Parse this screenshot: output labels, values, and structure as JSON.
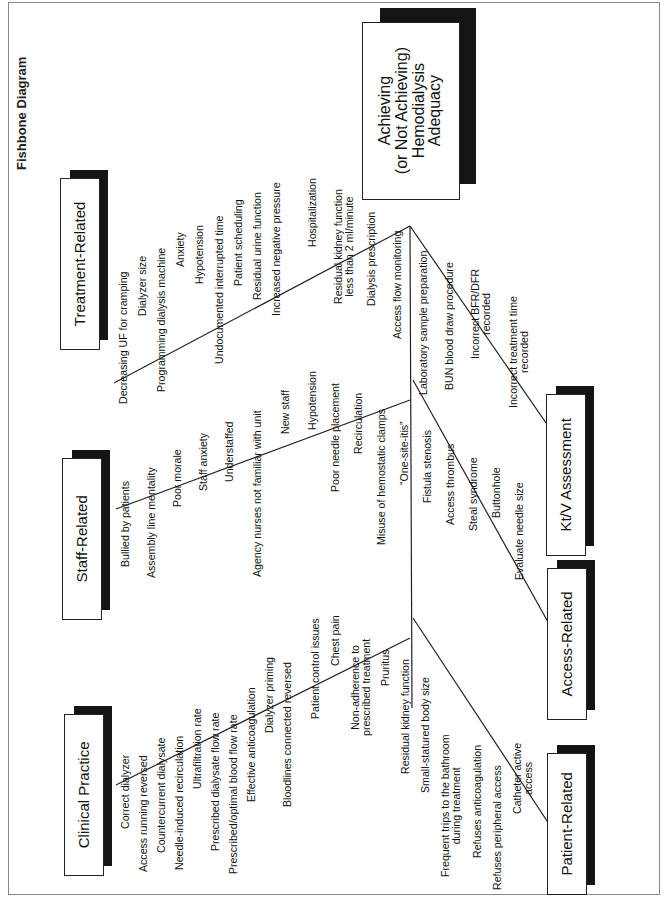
{
  "title_fragment": "Fishbone Diagram",
  "effect": {
    "label": "Achieving\n(or Not Achieving)\nHemodialysis\nAdequacy"
  },
  "categories": [
    {
      "id": "treatment",
      "label": "Treatment-Related",
      "items": [
        "Decreasing UF for cramping",
        "Dialyzer size",
        "Programming dialysis machine",
        "Anxiety",
        "Hypotension",
        "Undocumented interrupted time",
        "Patient scheduling",
        "Residual urine function",
        "Increased negative pressure"
      ]
    },
    {
      "id": "staff",
      "label": "Staff-Related",
      "items": [
        "Bullied by patients",
        "Assembly line mentality",
        "Poor morale",
        "Staff anxiety",
        "Understaffed",
        "Agency nurses not familiar with unit",
        "New staff"
      ]
    },
    {
      "id": "clinical",
      "label": "Clinical Practice",
      "items": [
        "Correct dialyzer",
        "Access running reversed",
        "Countercurrent dialysate",
        "Needle-induced recirculation",
        "Ultrafiltration rate",
        "Prescribed dialysate flow rate",
        "Prescribed/optimal blood flow rate",
        "Effective anticoagulation",
        "Dialyzer priming",
        "Bloodlines connected reversed"
      ]
    },
    {
      "id": "ktv",
      "label": "Kt/V Assessment",
      "items": [
        "Hospitalization",
        "Residual kidney function\nless than 2 ml/minute",
        "Dialysis prescription",
        "Access flow monitoring",
        "Laboratory sample preparation",
        "BUN blood draw procedure",
        "Incorrect BFR/DFR\nrecorded",
        "Incorrect treatment time\nrecorded"
      ]
    },
    {
      "id": "access",
      "label": "Access-Related",
      "items": [
        "Hypotension",
        "Poor needle placement",
        "Recirculation",
        "Misuse of hemostatic clamps",
        "“One-site-itis”",
        "Fistula stenosis",
        "Access thrombus",
        "Steal syndrome",
        "Buttonhole",
        "Evaluate needle size"
      ]
    },
    {
      "id": "patient",
      "label": "Patient-Related",
      "items": [
        "Patient control issues",
        "Chest pain",
        "Non-adherence to\nprescribed treatment",
        "Pruritus",
        "Residual kidney function",
        "Small-statured body size",
        "Frequent trips to the bathroom\nduring treatment",
        "Refuses anticoagulation",
        "Refuses peripheral access",
        "Catheter active\naccess"
      ]
    }
  ],
  "colors": {
    "line": "#222222",
    "shadow": "#141414",
    "frame": "#888888"
  }
}
